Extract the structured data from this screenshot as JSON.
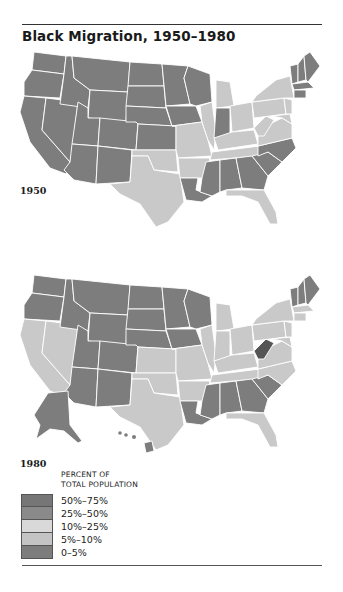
{
  "title": "Black Migration, 1950–1980",
  "maps": [
    {
      "year": "1950"
    },
    {
      "year": "1980"
    }
  ],
  "legend": {
    "title_line1": "PERCENT OF",
    "title_line2": "TOTAL POPULATION",
    "items": [
      {
        "label": "50%–75%",
        "color": "#767676"
      },
      {
        "label": "25%–50%",
        "color": "#8a8a8a"
      },
      {
        "label": "10%–25%",
        "color": "#d9d9d9"
      },
      {
        "label": "5%–10%",
        "color": "#c4c4c4"
      },
      {
        "label": "0–5%",
        "color": "#7d7d7d"
      }
    ]
  },
  "colors": {
    "dark": "#7d7d7d",
    "light": "#c9c9c9",
    "darkest": "#555555"
  }
}
